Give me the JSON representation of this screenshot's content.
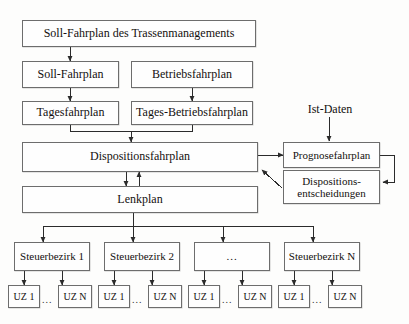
{
  "diagram": {
    "title_text": "Soll-Fahrplan des Trassenmanagements",
    "nodes": {
      "soll_fahrplan_trassen": "Soll-Fahrplan des Trassenmanagements",
      "soll_fahrplan": "Soll-Fahrplan",
      "betriebsfahrplan": "Betriebsfahrplan",
      "tagesfahrplan": "Tagesfahrplan",
      "tages_betriebsfahrplan": "Tages-Betriebsfahrplan",
      "dispositionsfahrplan": "Dispositionsfahrplan",
      "lenkplan": "Lenkplan",
      "ist_daten": "Ist-Daten",
      "prognosefahrplan": "Prognosefahrplan",
      "dispositions_entscheidungen_line1": "Dispositions-",
      "dispositions_entscheidungen_line2": "entscheidungen"
    },
    "steuerbezirke": [
      {
        "label": "Steuerbezirk 1"
      },
      {
        "label": "Steuerbezirk 2"
      },
      {
        "label": "..."
      },
      {
        "label": "Steuerbezirk N"
      }
    ],
    "uz_groups": [
      {
        "first": "UZ 1",
        "ellipsis": "...",
        "last": "UZ N"
      },
      {
        "first": "UZ 1",
        "ellipsis": "...",
        "last": "UZ N"
      },
      {
        "first": "UZ 1",
        "ellipsis": "...",
        "last": "UZ N"
      },
      {
        "first": "UZ 1",
        "ellipsis": "...",
        "last": "UZ N"
      }
    ],
    "colors": {
      "border": "#6d6d6d",
      "line": "#2b2b2b",
      "text": "#14100e",
      "background": "#fdfdfc",
      "node_fill": "#fefefe"
    }
  }
}
